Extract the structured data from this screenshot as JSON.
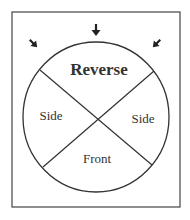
{
  "diagram": {
    "colors": {
      "stroke": "#333333",
      "background": "#ffffff"
    },
    "regions": {
      "top": "Reverse",
      "left": "Side",
      "right": "Side",
      "bottom": "Front"
    },
    "arrows": [
      {
        "position": "top-center",
        "direction": "down"
      },
      {
        "position": "top-left",
        "direction": "down-right"
      },
      {
        "position": "top-right",
        "direction": "down-left"
      }
    ]
  }
}
